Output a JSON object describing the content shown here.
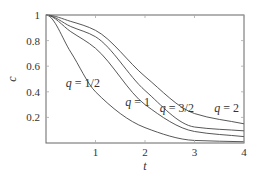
{
  "chart_data": {
    "type": "line",
    "title": "",
    "xlabel": "t",
    "ylabel": "c",
    "xlim": [
      0,
      4
    ],
    "ylim": [
      0,
      1
    ],
    "xticks": [
      1,
      2,
      3,
      4
    ],
    "xtick_labels": [
      "1",
      "2",
      "3",
      "4"
    ],
    "yticks": [
      0.2,
      0.4,
      0.6,
      0.8,
      1
    ],
    "ytick_labels": [
      "0.2",
      "0.4",
      "0.6",
      "0.8",
      "1"
    ],
    "grid": false,
    "legend": "none (inline curve labels)",
    "x": [
      0,
      0.5,
      1,
      2,
      3,
      4
    ],
    "series": [
      {
        "name": "q = 1/2",
        "values": [
          1,
          0.71,
          0.4,
          0.12,
          0.02,
          0.01
        ]
      },
      {
        "name": "q = 1",
        "values": [
          1,
          0.87,
          0.74,
          0.3,
          0.09,
          0.05
        ]
      },
      {
        "name": "q = 3/2",
        "values": [
          1,
          0.91,
          0.83,
          0.41,
          0.125,
          0.095
        ]
      },
      {
        "name": "q = 2",
        "values": [
          1,
          0.95,
          0.88,
          0.52,
          0.23,
          0.15
        ]
      }
    ],
    "annotations": [
      {
        "text": "q = 1/2",
        "x": 0.4,
        "y": 0.44
      },
      {
        "text": "q = 1",
        "x": 1.6,
        "y": 0.29
      },
      {
        "text": "q = 3/2",
        "x": 2.3,
        "y": 0.24
      },
      {
        "text": "q = 2",
        "x": 3.4,
        "y": 0.24
      }
    ]
  }
}
